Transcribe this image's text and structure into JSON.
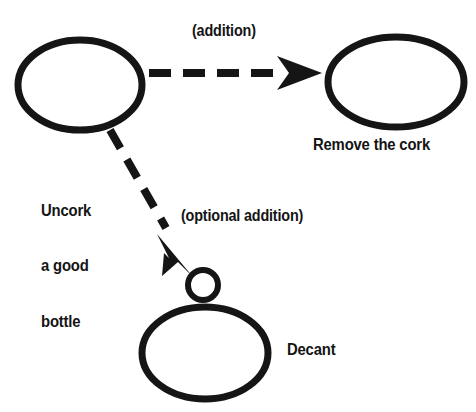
{
  "diagram": {
    "type": "node-link-diagram",
    "background_color": "#ffffff",
    "stroke_color": "#151515",
    "nodes": [
      {
        "id": "uncork",
        "label": "Uncork\na good\nbottle",
        "label_line_1": "Uncork",
        "label_line_2": "a good",
        "label_line_3": "bottle",
        "shape": "ellipse",
        "cx": 80,
        "cy": 85,
        "rx": 62,
        "ry": 45
      },
      {
        "id": "remove-the-cork",
        "label": "Remove the cork",
        "shape": "ellipse",
        "cx": 396,
        "cy": 82,
        "rx": 68,
        "ry": 45
      },
      {
        "id": "decant",
        "label": "Decant",
        "shape": "ellipse",
        "cx": 205,
        "cy": 353,
        "rx": 63,
        "ry": 46
      },
      {
        "id": "optional-junction",
        "label": "",
        "shape": "circle",
        "cx": 203,
        "cy": 285,
        "rx": 17,
        "ry": 17
      }
    ],
    "edges": [
      {
        "id": "edge-addition",
        "label": "(addition)",
        "from": "uncork",
        "to": "remove-the-cork",
        "style": "dashed",
        "arrowhead": "barbed",
        "x1": 149,
        "y1": 73,
        "x2": 320,
        "y2": 73
      },
      {
        "id": "edge-optional-addition",
        "label": "(optional addition)",
        "from": "uncork",
        "to": "optional-junction",
        "style": "dashed",
        "arrowhead": "barbed",
        "x1": 110,
        "y1": 130,
        "x2": 192,
        "y2": 274
      }
    ]
  }
}
